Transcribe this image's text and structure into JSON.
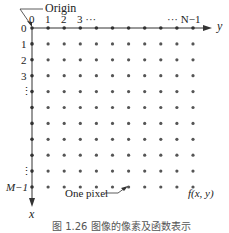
{
  "diagram": {
    "origin_label": "Origin",
    "y_axis_label": "y",
    "x_axis_label": "x",
    "column_labels": [
      "0",
      "1",
      "2",
      "3 ···",
      "··· N−1"
    ],
    "row_labels": [
      "0",
      "1",
      "2",
      "3",
      "⋮",
      "⋮",
      "M−1"
    ],
    "pixel_annotation": "One pixel",
    "function_label": "f(x, y)",
    "caption": "图 1.26   图像的像素及函数表示",
    "grid": {
      "columns": 11,
      "rows": 11
    },
    "colors": {
      "ink": "#222222",
      "dot": "#555555"
    }
  }
}
